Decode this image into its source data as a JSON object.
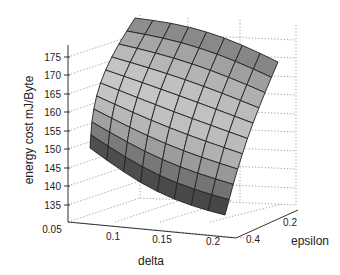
{
  "chart_data": {
    "type": "surface3d",
    "title": "",
    "xlabel": "delta",
    "ylabel": "epsilon",
    "zlabel": "energy cost mJ/Byte",
    "x_ticks": [
      "0.05",
      "0.1",
      "0.15",
      "0.2"
    ],
    "y_ticks": [
      "0.2",
      "0.4"
    ],
    "z_ticks": [
      "135",
      "140",
      "145",
      "150",
      "155",
      "160",
      "165",
      "170",
      "175"
    ],
    "xlim": [
      0.05,
      0.22
    ],
    "ylim": [
      0.1,
      0.45
    ],
    "zlim": [
      132,
      178
    ],
    "grid": true,
    "colormap": "gray",
    "surface_grid": {
      "rows": 10,
      "cols": 8
    },
    "corner_values": {
      "delta_0.05_epsilon_0.1": 152,
      "delta_0.05_epsilon_0.45": 176,
      "delta_0.22_epsilon_0.1": 168,
      "delta_0.22_epsilon_0.45": 133
    }
  },
  "labels": {
    "x_axis": "delta",
    "y_axis": "epsilon",
    "z_axis": "energy cost mJ/Byte"
  }
}
